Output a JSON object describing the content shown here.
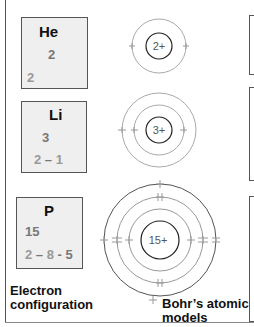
{
  "elements": [
    {
      "symbol": "He",
      "atomic_number": "2",
      "configuration": [
        "2"
      ],
      "nucleus_label": "2+"
    },
    {
      "symbol": "Li",
      "atomic_number": "3",
      "configuration": [
        "2",
        "1"
      ],
      "nucleus_label": "3+"
    },
    {
      "symbol": "P",
      "atomic_number": "15",
      "configuration": [
        "2",
        "8",
        "5"
      ],
      "nucleus_label": "15+"
    }
  ],
  "config_text": {
    "he": "2",
    "li_a": "2",
    "li_sep": " – ",
    "li_b": "1",
    "p_a": "2",
    "p_sep1": " – ",
    "p_b": "8",
    "p_sep2": " - ",
    "p_c": "5"
  },
  "captions": {
    "left": "Electron configuration",
    "left_line1": "Electron",
    "left_line2": "configuration",
    "right_line1": "Bohr’s atomic",
    "right_line2": "models"
  },
  "colors": {
    "box_bg": "#efefef",
    "border": "#555555",
    "shell": "#999999",
    "nucleus": "#222222",
    "muted_text": "#777777"
  }
}
